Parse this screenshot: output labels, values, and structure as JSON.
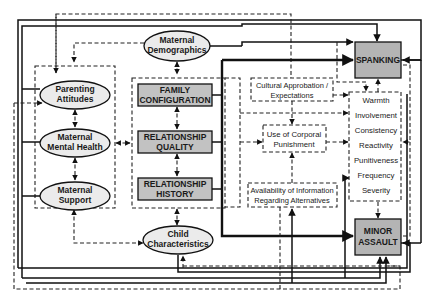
{
  "diagram": {
    "nodes": {
      "maternal_demographics": [
        "Maternal",
        "Demographics"
      ],
      "parenting_attitudes": [
        "Parenting",
        "Attitudes"
      ],
      "maternal_mental_health": [
        "Maternal",
        "Mental Health"
      ],
      "maternal_support": [
        "Maternal",
        "Support"
      ],
      "child_characteristics": [
        "Child",
        "Characteristics"
      ],
      "family_configuration": [
        "FAMILY",
        "CONFIGURATION"
      ],
      "relationship_quality": [
        "RELATIONSHIP",
        "QUALITY"
      ],
      "relationship_history": [
        "RELATIONSHIP",
        "HISTORY"
      ],
      "cultural_approbation": [
        "Cultural Approbation /",
        "Expectations"
      ],
      "use_of_corporal_punishment": [
        "Use of Corporal",
        "Punishment"
      ],
      "availability_of_information": [
        "Availability of Information",
        "Regarding Alternatives"
      ],
      "spanking": [
        "SPANKING"
      ],
      "minor_assault": [
        "MINOR",
        "ASSAULT"
      ]
    },
    "parenting_dimensions": [
      "Warmth",
      "Involvement",
      "Consistency",
      "Reactivity",
      "Punitiveness",
      "Frequency",
      "Severity"
    ],
    "legend": {
      "solid_line": "direct path",
      "dashed_line": "indirect / reciprocal path"
    },
    "colors": {
      "ellipse_fill": "#ebebeb",
      "box_fill": "#c2c2c2",
      "outcome_fill": "#b4b4b4",
      "line": "#111111"
    }
  }
}
